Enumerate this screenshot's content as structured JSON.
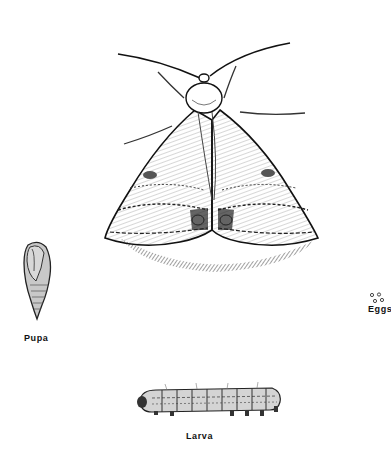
{
  "illustration": {
    "subject": "moth life cycle",
    "stages": [
      {
        "id": "adult",
        "label": ""
      },
      {
        "id": "pupa",
        "label": "Pupa"
      },
      {
        "id": "eggs",
        "label": "Eggs"
      },
      {
        "id": "larva",
        "label": "Larva"
      }
    ],
    "colors": {
      "ink": "#111111",
      "shade": "#bdbdbd",
      "paper": "#ffffff"
    }
  }
}
